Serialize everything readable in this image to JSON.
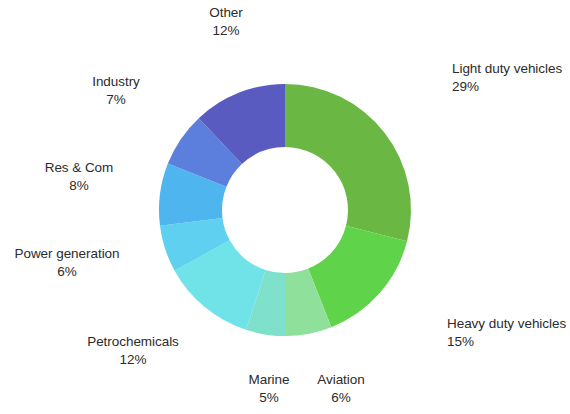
{
  "chart_data": {
    "type": "pie",
    "variant": "donut",
    "title": "",
    "subtitle": "",
    "xlabel": "",
    "ylabel": "",
    "units": "percent",
    "grid": false,
    "legend": "none",
    "labels_position": "outside",
    "start_angle_deg": 0,
    "direction": "clockwise",
    "inner_radius_ratio": 0.5,
    "total": 100,
    "categories": [
      "Light duty vehicles",
      "Heavy duty vehicles",
      "Aviation",
      "Marine",
      "Petrochemicals",
      "Power generation",
      "Res & Com",
      "Industry",
      "Other"
    ],
    "values": [
      29,
      15,
      6,
      5,
      12,
      6,
      8,
      7,
      12
    ],
    "value_labels": [
      "29%",
      "15%",
      "6%",
      "5%",
      "12%",
      "6%",
      "8%",
      "7%",
      "12%"
    ],
    "colors": [
      "#6AB843",
      "#5FD34A",
      "#8FE09A",
      "#7FE0CC",
      "#6FE3E8",
      "#5FD0F0",
      "#4FB5EE",
      "#5C7FDE",
      "#5A5BC0"
    ],
    "slices": [
      {
        "label": "Light duty vehicles",
        "value": 29,
        "value_label": "29%",
        "color": "#6AB843"
      },
      {
        "label": "Heavy duty vehicles",
        "value": 15,
        "value_label": "15%",
        "color": "#5FD34A"
      },
      {
        "label": "Aviation",
        "value": 6,
        "value_label": "6%",
        "color": "#8FE09A"
      },
      {
        "label": "Marine",
        "value": 5,
        "value_label": "5%",
        "color": "#7FE0CC"
      },
      {
        "label": "Petrochemicals",
        "value": 12,
        "value_label": "12%",
        "color": "#6FE3E8"
      },
      {
        "label": "Power generation",
        "value": 6,
        "value_label": "6%",
        "color": "#5FD0F0"
      },
      {
        "label": "Res & Com",
        "value": 8,
        "value_label": "8%",
        "color": "#4FB5EE"
      },
      {
        "label": "Industry",
        "value": 7,
        "value_label": "7%",
        "color": "#5C7FDE"
      },
      {
        "label": "Other",
        "value": 12,
        "value_label": "12%",
        "color": "#5A5BC0"
      }
    ]
  },
  "labels": {
    "light_duty": {
      "name": "Light duty vehicles",
      "value": "29%"
    },
    "heavy_duty": {
      "name": "Heavy duty vehicles",
      "value": "15%"
    },
    "aviation": {
      "name": "Aviation",
      "value": "6%"
    },
    "marine": {
      "name": "Marine",
      "value": "5%"
    },
    "petrochem": {
      "name": "Petrochemicals",
      "value": "12%"
    },
    "power_gen": {
      "name": "Power generation",
      "value": "6%"
    },
    "res_com": {
      "name": "Res & Com",
      "value": "8%"
    },
    "industry": {
      "name": "Industry",
      "value": "7%"
    },
    "other": {
      "name": "Other",
      "value": "12%"
    }
  },
  "geometry": {
    "center_x": 285,
    "center_y": 210,
    "outer_radius": 126,
    "inner_radius": 63
  }
}
